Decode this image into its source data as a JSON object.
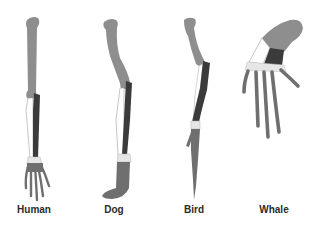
{
  "colors": {
    "humerus": "#8e8e8e",
    "radius_dark": "#3b3b3b",
    "ulna_light": "#ffffff",
    "carpals": "#e6e6e6",
    "hand": "#6f6f6f",
    "outline": "#9a9a9a",
    "label": "#2b2b2b"
  },
  "limbs": [
    {
      "name": "Human",
      "label": "Human"
    },
    {
      "name": "Dog",
      "label": "Dog"
    },
    {
      "name": "Bird",
      "label": "Bird"
    },
    {
      "name": "Whale",
      "label": "Whale"
    }
  ]
}
